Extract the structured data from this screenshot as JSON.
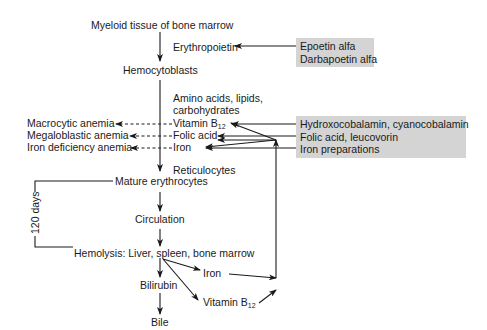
{
  "diagram": {
    "nodes": {
      "myeloid": "Myeloid tissue of bone marrow",
      "erythropoietin": "Erythropoietin",
      "hemocytoblasts": "Hemocytoblasts",
      "nutrients_line1": "Amino acids, lipids,",
      "nutrients_line2": "carbohydrates",
      "vitamin_b12": "Vitamin B",
      "vitamin_b12_sub": "12",
      "folic_acid": "Folic acid",
      "iron": "Iron",
      "reticulocytes": "Reticulocytes",
      "mature": "Mature erythrocytes",
      "circulation": "Circulation",
      "hemolysis": "Hemolysis: Liver, spleen, bone marrow",
      "bilirubin": "Bilirubin",
      "bile": "Bile",
      "recycled_iron": "Iron",
      "recycled_b12": "Vitamin B",
      "recycled_b12_sub": "12",
      "lifespan": "120 days"
    },
    "anemias": [
      "Macrocytic anemia",
      "Megaloblastic anemia",
      "Iron deficiency anemia"
    ],
    "drug_boxes": [
      {
        "lines": [
          "Epoetin alfa",
          "Darbapoetin alfa"
        ]
      },
      {
        "lines": [
          "Hydroxocobalamin, cyanocobalamin",
          "Folic acid, leucovorin",
          "Iron preparations"
        ]
      }
    ],
    "colors": {
      "box_fill": "#d4d4d4",
      "line": "#1a1a1a"
    }
  }
}
